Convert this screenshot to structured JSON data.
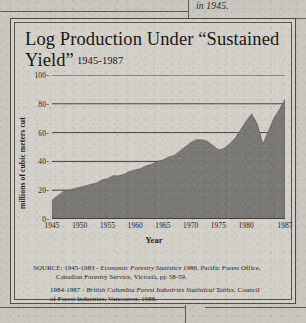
{
  "page": {
    "top_caption": "in 1945."
  },
  "figure": {
    "title_line1": "Log Production Under “Sustained",
    "title_line2": "Yield”",
    "title_years": "1945-1987",
    "source": {
      "line1_prefix": "SOURCE: 1945-1983 - ",
      "line1_italic": "Economic Forestry Statistics",
      "line1_suffix": " 1986, Pacific Forest Office,",
      "line2": "Canadian Forestry Service, Victoria, pp 58-59.",
      "line3_prefix": "1984-1987 - ",
      "line3_italic": "British Columbia Forest Industries Statistical Tables",
      "line3_suffix": ", Council",
      "line4": "of Forest Industries, Vancouver, 1988."
    }
  },
  "chart_data": {
    "type": "area",
    "xlabel": "Year",
    "ylabel": "millions of cubic meters cut",
    "xlim": [
      1945,
      1987
    ],
    "ylim": [
      0,
      100
    ],
    "yticks": [
      0,
      20,
      40,
      60,
      80,
      100
    ],
    "xticks": [
      1945,
      1950,
      1955,
      1960,
      1965,
      1970,
      1975,
      1980,
      1987
    ],
    "grid": true,
    "fill_color": "#7b7975",
    "x": [
      1945,
      1946,
      1947,
      1948,
      1949,
      1950,
      1951,
      1952,
      1953,
      1954,
      1955,
      1956,
      1957,
      1958,
      1959,
      1960,
      1961,
      1962,
      1963,
      1964,
      1965,
      1966,
      1967,
      1968,
      1969,
      1970,
      1971,
      1972,
      1973,
      1974,
      1975,
      1976,
      1977,
      1978,
      1979,
      1980,
      1981,
      1982,
      1983,
      1984,
      1985,
      1986,
      1987
    ],
    "values": [
      13,
      16,
      19,
      20,
      21,
      22,
      23,
      24,
      25,
      27,
      28,
      30,
      30,
      31,
      33,
      34,
      35,
      37,
      38,
      40,
      41,
      43,
      44,
      47,
      50,
      53,
      55,
      55,
      54,
      51,
      48,
      49,
      52,
      56,
      62,
      68,
      73,
      66,
      52,
      61,
      70,
      76,
      83
    ],
    "series_name": "Log production (millions of cubic meters cut)"
  }
}
